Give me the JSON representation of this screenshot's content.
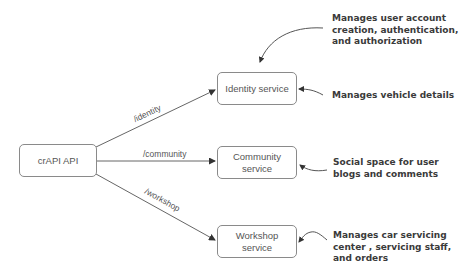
{
  "diagram": {
    "gateway": {
      "label": "crAPI API"
    },
    "services": [
      {
        "label": "Identity service"
      },
      {
        "label": "Community\nservice"
      },
      {
        "label": "Workshop\nservice"
      }
    ],
    "edges": [
      {
        "from": "crAPI API",
        "to": "Identity service",
        "label": "/identity"
      },
      {
        "from": "crAPI API",
        "to": "Community service",
        "label": "/community"
      },
      {
        "from": "crAPI API",
        "to": "Workshop service",
        "label": "/workshop"
      }
    ],
    "annotations": [
      {
        "target": "Identity service",
        "text": "Manages user account\ncreation, authentication,\nand authorization"
      },
      {
        "target": "Identity service",
        "text": "Manages vehicle details"
      },
      {
        "target": "Community service",
        "text": "Social space for user\nblogs and comments"
      },
      {
        "target": "Workshop service",
        "text": "Manages car servicing\ncenter , servicing staff,\nand orders"
      }
    ],
    "colors": {
      "box_border": "#8a8a8a",
      "line": "#555555",
      "annotation_text": "#3a3a3a"
    }
  }
}
